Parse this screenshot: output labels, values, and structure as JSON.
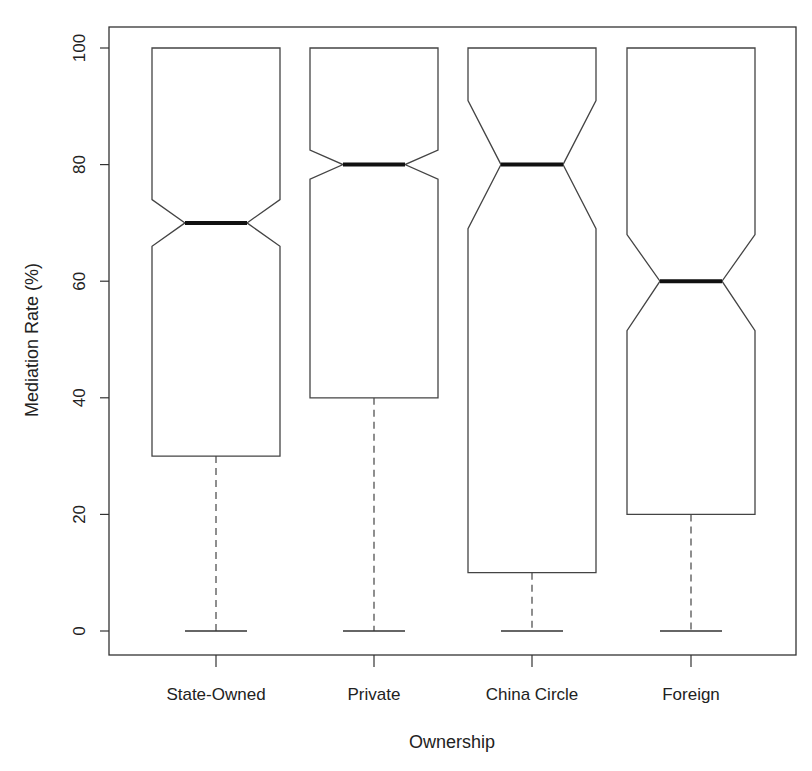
{
  "chart_data": {
    "type": "boxplot",
    "notched": true,
    "title": "",
    "xlabel": "Ownership",
    "ylabel": "Mediation Rate (%)",
    "ylim": [
      0,
      100
    ],
    "yticks": [
      0,
      20,
      40,
      60,
      80,
      100
    ],
    "categories": [
      "State-Owned",
      "Private",
      "China Circle",
      "Foreign"
    ],
    "series": [
      {
        "name": "State-Owned",
        "min": 0,
        "q1": 30,
        "median": 70,
        "q3": 100,
        "max": 100,
        "notch_low": 66,
        "notch_high": 74
      },
      {
        "name": "Private",
        "min": 0,
        "q1": 40,
        "median": 80,
        "q3": 100,
        "max": 100,
        "notch_low": 77.5,
        "notch_high": 82.5
      },
      {
        "name": "China Circle",
        "min": 0,
        "q1": 10,
        "median": 80,
        "q3": 100,
        "max": 100,
        "notch_low": 69,
        "notch_high": 91
      },
      {
        "name": "Foreign",
        "min": 0,
        "q1": 20,
        "median": 60,
        "q3": 100,
        "max": 100,
        "notch_low": 51.5,
        "notch_high": 68
      }
    ],
    "grid": false,
    "legend": null
  },
  "colors": {
    "background": "#ffffff",
    "line": "#444444",
    "median": "#111111"
  }
}
